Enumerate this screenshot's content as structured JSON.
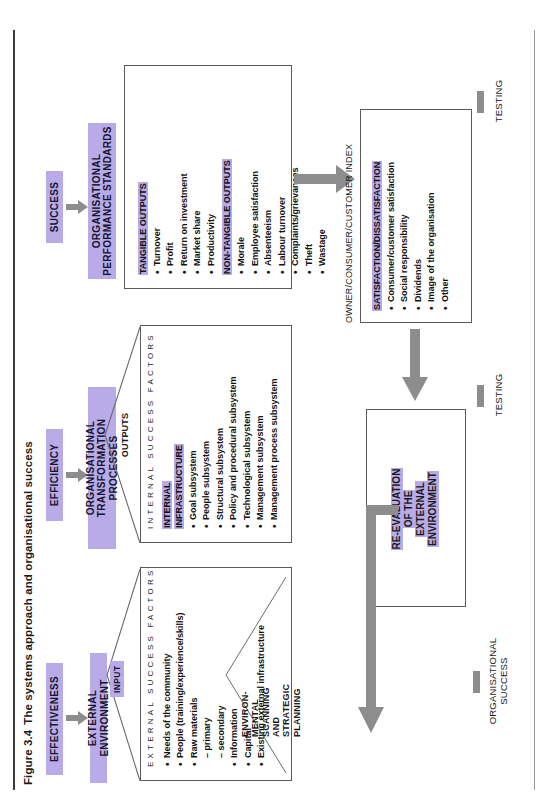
{
  "caption": {
    "number": "Figure 3.4",
    "text": "The systems approach and organisational success"
  },
  "colors": {
    "highlight": "#b9aae8",
    "highlight_light": "#c8bcee",
    "arrow": "#8d8d8d",
    "box_border": "#5a5a5a",
    "text": "#1a1a1a"
  },
  "criteria": {
    "effectiveness": "EFFECTIVENESS",
    "efficiency": "EFFICIENCY",
    "success": "SUCCESS"
  },
  "stages": {
    "external_environment": "EXTERNAL ENVIRONMENT",
    "transformation": "ORGANISATIONAL\nTRANSFORMATION PROCESSES",
    "transformation_line1": "ORGANISATIONAL",
    "transformation_line2": "TRANSFORMATION PROCESSES",
    "performance_standards": "ORGANISATIONAL\nPERFORMANCE STANDARDS",
    "performance_line1": "ORGANISATIONAL",
    "performance_line2": "PERFORMANCE STANDARDS"
  },
  "flow_labels": {
    "input": "INPUT",
    "outputs": "OUTPUTS"
  },
  "vertical_axes": {
    "external_success_factors": "EXTERNAL SUCCESS FACTORS",
    "internal_success_factors": "INTERNAL SUCCESS FACTORS"
  },
  "external_box": {
    "items": [
      "Needs of the community",
      "People (training/experience/skills)",
      "Raw materials",
      "Information",
      "Capital",
      "Existing external infrastructure"
    ],
    "raw_material_subitems": [
      "– primary",
      "– secondary"
    ],
    "roof_label": "ENVIRON-\nMENTAL\nSCANNING\nAND\nSTRATEGIC\nPLANNING",
    "roof_label_lines": [
      "ENVIRON-",
      "MENTAL",
      "SCANNING",
      "AND",
      "STRATEGIC",
      "PLANNING"
    ]
  },
  "transformation_box": {
    "header": "INTERNAL\nINFRASTRUCTURE",
    "header_line1": "INTERNAL",
    "header_line2": "INFRASTRUCTURE",
    "items": [
      "Goal subsystem",
      "People subsystem",
      "Structural subsystem",
      "Policy and procedural subsystem",
      "Technological subsystem",
      "Management subsystem",
      "Management process subsystem"
    ]
  },
  "performance_box": {
    "tangible_header": "TANGIBLE OUTPUTS",
    "tangible_items": [
      "Turnover",
      "Profit",
      "Return on investment",
      "Market share",
      "Productivity"
    ],
    "nontangible_header": "NON-TANGIBLE OUTPUTS",
    "nontangible_items": [
      "Morale",
      "Employee satisfaction",
      "Absenteeism",
      "Labour turnover",
      "Complaints/grievances",
      "Theft",
      "Wastage"
    ]
  },
  "index_box": {
    "title": "OWNER/CONSUMER/CUSTOMER INDEX",
    "header": "SATISFACTION/DISSATISFACTION",
    "items": [
      "Consumer/customer satisfaction",
      "Social responsibility",
      "Dividends",
      "Image of the organisation",
      "Other"
    ]
  },
  "reevaluation_box": {
    "lines": [
      "RE-EVALUATION",
      "OF THE",
      "EXTERNAL",
      "ENVIRONMENT"
    ]
  },
  "feedback_labels": {
    "testing_right": "TESTING",
    "testing_mid": "TESTING",
    "organisational_success": "ORGANISATIONAL\nSUCCESS",
    "organisational_success_line1": "ORGANISATIONAL",
    "organisational_success_line2": "SUCCESS"
  }
}
